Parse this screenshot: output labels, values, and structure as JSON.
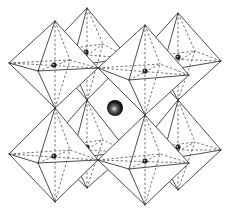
{
  "diagram": {
    "title": "Perovskite crystal structure (ABO3) — corner-sharing BO6 octahedra with central A-site cation",
    "structure_type": "perovskite",
    "octahedra_count": 8,
    "elements": {
      "octahedra": [
        {
          "id": "back-top-left",
          "center": [
            86,
            52
          ],
          "top": [
            87,
            8
          ],
          "bottom": [
            87,
            100
          ],
          "left": [
            45,
            52
          ],
          "right": [
            128,
            58
          ],
          "front": [
            72,
            66
          ],
          "back": [
            103,
            44
          ]
        },
        {
          "id": "back-top-right",
          "center": [
            178,
            57
          ],
          "top": [
            178,
            13
          ],
          "bottom": [
            178,
            100
          ],
          "left": [
            137,
            58
          ],
          "right": [
            221,
            61
          ],
          "front": [
            162,
            71
          ],
          "back": [
            195,
            51
          ]
        },
        {
          "id": "front-top-left",
          "center": [
            54,
            65
          ],
          "top": [
            55,
            21
          ],
          "bottom": [
            55,
            108
          ],
          "left": [
            9,
            63
          ],
          "right": [
            98,
            68
          ],
          "front": [
            38,
            71
          ],
          "back": [
            70,
            60
          ]
        },
        {
          "id": "front-top-right",
          "center": [
            145,
            71
          ],
          "top": [
            145,
            25
          ],
          "bottom": [
            145,
            115
          ],
          "left": [
            98,
            68
          ],
          "right": [
            189,
            75
          ],
          "front": [
            129,
            80
          ],
          "back": [
            160,
            64
          ]
        },
        {
          "id": "back-bottom-left",
          "center": [
            87,
            147
          ],
          "top": [
            87,
            100
          ],
          "bottom": [
            87,
            188
          ],
          "left": [
            45,
            148
          ],
          "right": [
            128,
            152
          ],
          "front": [
            72,
            158
          ],
          "back": [
            103,
            140
          ]
        },
        {
          "id": "back-bottom-right",
          "center": [
            178,
            147
          ],
          "top": [
            178,
            100
          ],
          "bottom": [
            178,
            190
          ],
          "left": [
            137,
            150
          ],
          "right": [
            221,
            150
          ],
          "front": [
            162,
            160
          ],
          "back": [
            195,
            142
          ]
        },
        {
          "id": "front-bottom-left",
          "center": [
            54,
            156
          ],
          "top": [
            55,
            108
          ],
          "bottom": [
            55,
            202
          ],
          "left": [
            9,
            154
          ],
          "right": [
            98,
            160
          ],
          "front": [
            38,
            163
          ],
          "back": [
            70,
            150
          ]
        },
        {
          "id": "front-bottom-right",
          "center": [
            145,
            161
          ],
          "top": [
            145,
            115
          ],
          "bottom": [
            145,
            205
          ],
          "left": [
            98,
            160
          ],
          "right": [
            189,
            163
          ],
          "front": [
            129,
            169
          ],
          "back": [
            160,
            154
          ]
        }
      ],
      "b_site_atoms": [
        {
          "pos": [
            86,
            52
          ]
        },
        {
          "pos": [
            178,
            57
          ]
        },
        {
          "pos": [
            54,
            65
          ]
        },
        {
          "pos": [
            145,
            71
          ]
        },
        {
          "pos": [
            87,
            147
          ]
        },
        {
          "pos": [
            178,
            147
          ]
        },
        {
          "pos": [
            54,
            156
          ]
        },
        {
          "pos": [
            145,
            161
          ]
        }
      ],
      "a_site_atom": {
        "pos": [
          115,
          108
        ],
        "radius": 8
      }
    },
    "colors": {
      "background": "#ffffff",
      "edges": "#3a3a3a",
      "b_atom": "#222222",
      "a_atom_dark": "#111111",
      "a_atom_highlight": "#dddddd"
    }
  }
}
